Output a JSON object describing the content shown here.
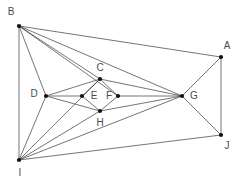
{
  "figure": {
    "type": "geometric-graph-diagram",
    "background_color": "#ffffff",
    "edge_color": "#3a3a3a",
    "vertex_color": "#111111",
    "label_color": "#4a4a4a",
    "width": 240,
    "height": 186
  },
  "vertices": [
    {
      "id": "A",
      "label": "A",
      "x": 221,
      "y": 57,
      "label_x": 227,
      "label_y": 46
    },
    {
      "id": "B",
      "label": "B",
      "x": 19,
      "y": 26,
      "label_x": 11,
      "label_y": 12
    },
    {
      "id": "C",
      "label": "C",
      "x": 100,
      "y": 79,
      "label_x": 100,
      "label_y": 68
    },
    {
      "id": "D",
      "label": "D",
      "x": 46,
      "y": 96,
      "label_x": 34,
      "label_y": 94
    },
    {
      "id": "E",
      "label": "E",
      "x": 82,
      "y": 96,
      "label_x": 94,
      "label_y": 96
    },
    {
      "id": "F",
      "label": "F",
      "x": 118,
      "y": 96,
      "label_x": 109,
      "label_y": 96
    },
    {
      "id": "G",
      "label": "G",
      "x": 182,
      "y": 96,
      "label_x": 194,
      "label_y": 96
    },
    {
      "id": "H",
      "label": "H",
      "x": 100,
      "y": 111,
      "label_x": 100,
      "label_y": 123
    },
    {
      "id": "I",
      "label": "I",
      "x": 19,
      "y": 160,
      "label_x": 20,
      "label_y": 173
    },
    {
      "id": "J",
      "label": "J",
      "x": 221,
      "y": 135,
      "label_x": 227,
      "label_y": 146
    }
  ],
  "edges": [
    {
      "from": "B",
      "to": "A"
    },
    {
      "from": "B",
      "to": "I"
    },
    {
      "from": "B",
      "to": "D"
    },
    {
      "from": "B",
      "to": "C"
    },
    {
      "from": "B",
      "to": "F"
    },
    {
      "from": "B",
      "to": "G"
    },
    {
      "from": "A",
      "to": "G"
    },
    {
      "from": "A",
      "to": "J"
    },
    {
      "from": "J",
      "to": "G"
    },
    {
      "from": "J",
      "to": "I"
    },
    {
      "from": "I",
      "to": "D"
    },
    {
      "from": "I",
      "to": "C"
    },
    {
      "from": "I",
      "to": "H"
    },
    {
      "from": "I",
      "to": "G"
    },
    {
      "from": "D",
      "to": "C"
    },
    {
      "from": "D",
      "to": "E"
    },
    {
      "from": "D",
      "to": "H"
    },
    {
      "from": "C",
      "to": "E"
    },
    {
      "from": "C",
      "to": "F"
    },
    {
      "from": "C",
      "to": "G"
    },
    {
      "from": "E",
      "to": "H"
    },
    {
      "from": "F",
      "to": "H"
    },
    {
      "from": "F",
      "to": "G"
    },
    {
      "from": "H",
      "to": "G"
    }
  ]
}
